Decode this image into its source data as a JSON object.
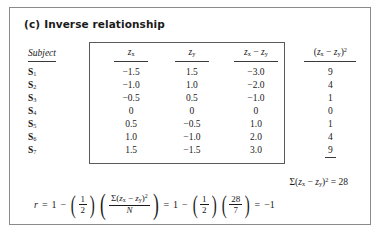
{
  "figure": {
    "caption_letter": "(c)",
    "caption_text": "Inverse relationship"
  },
  "table": {
    "headers": {
      "subject": "Subject",
      "zx": "z",
      "zx_sub": "x",
      "zy": "z",
      "zy_sub": "y",
      "diff_open": "z",
      "diff_sub1": "x",
      "diff_minus": " − ",
      "diff_z2": "z",
      "diff_sub2": "y",
      "sq_lparen": "(",
      "sq_z1": "z",
      "sq_sub1": "x",
      "sq_minus": " − ",
      "sq_z2": "z",
      "sq_sub2": "y",
      "sq_rparen": ")",
      "sq_exp": "2"
    },
    "rows": [
      {
        "subject": "S",
        "subject_sub": "1",
        "zx": "−1.5",
        "zy": "1.5",
        "diff": "−3.0",
        "sq": "9"
      },
      {
        "subject": "S",
        "subject_sub": "2",
        "zx": "−1.0",
        "zy": "1.0",
        "diff": "−2.0",
        "sq": "4"
      },
      {
        "subject": "S",
        "subject_sub": "3",
        "zx": "−0.5",
        "zy": "0.5",
        "diff": "−1.0",
        "sq": "1"
      },
      {
        "subject": "S",
        "subject_sub": "4",
        "zx": "0",
        "zy": "0",
        "diff": "0",
        "sq": "0"
      },
      {
        "subject": "S",
        "subject_sub": "5",
        "zx": "0.5",
        "zy": "−0.5",
        "diff": "1.0",
        "sq": "1"
      },
      {
        "subject": "S",
        "subject_sub": "6",
        "zx": "1.0",
        "zy": "−1.0",
        "diff": "2.0",
        "sq": "4"
      },
      {
        "subject": "S",
        "subject_sub": "7",
        "zx": "1.5",
        "zy": "−1.5",
        "diff": "3.0",
        "sq": "9"
      }
    ]
  },
  "sum_line": {
    "sigma": "Σ",
    "lparen": "(",
    "z1": "z",
    "sub1": "x",
    "minus": " − ",
    "z2": "z",
    "sub2": "y",
    "rparen": ")",
    "exp": "2",
    "equals": " = ",
    "value": "28"
  },
  "equation": {
    "r": "r",
    "eq1": "=",
    "one_a": "1",
    "minus_a": "−",
    "half_num_a": "1",
    "half_den_a": "2",
    "sigma_num_sigma": "Σ",
    "sigma_num_lparen": "(",
    "sigma_num_z1": "z",
    "sigma_num_sub1": "x",
    "sigma_num_minus": " − ",
    "sigma_num_z2": "z",
    "sigma_num_sub2": "y",
    "sigma_num_rparen": ")",
    "sigma_num_exp": "2",
    "sigma_den": "N",
    "eq2": "=",
    "one_b": "1",
    "minus_b": "−",
    "half_num_b": "1",
    "half_den_b": "2",
    "frac28_num": "28",
    "frac28_den": "7",
    "eq3": "=",
    "result": "−1"
  }
}
